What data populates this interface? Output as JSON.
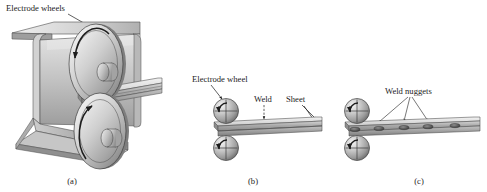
{
  "figure": {
    "background_color": "#ffffff",
    "ink_color": "#1d1d1d",
    "metal_light": "#e8e8e8",
    "metal_mid": "#bdbdbd",
    "metal_dark": "#8a8a8a",
    "metal_shadow": "#6a6a6a",
    "nugget_color": "#5a5a5a"
  },
  "panels": [
    {
      "id": "a",
      "caption": "(a)",
      "labels": [
        {
          "name": "electrode-wheels-label",
          "text": "Electrode wheels"
        }
      ],
      "parts": {
        "workpiece": "C-channel sheet",
        "wheel_count": 2
      }
    },
    {
      "id": "b",
      "caption": "(b)",
      "labels": [
        {
          "name": "electrode-wheel-label",
          "text": "Electrode wheel"
        },
        {
          "name": "weld-label",
          "text": "Weld"
        },
        {
          "name": "sheet-label",
          "text": "Sheet"
        }
      ],
      "parts": {
        "workpiece": "two lapped sheets",
        "wheel_count": 2
      }
    },
    {
      "id": "c",
      "caption": "(c)",
      "labels": [
        {
          "name": "weld-nuggets-label",
          "text": "Weld nuggets"
        }
      ],
      "parts": {
        "workpiece": "two lapped sheets",
        "wheel_count": 2,
        "nugget_count": 5,
        "leader_count": 3
      }
    }
  ]
}
